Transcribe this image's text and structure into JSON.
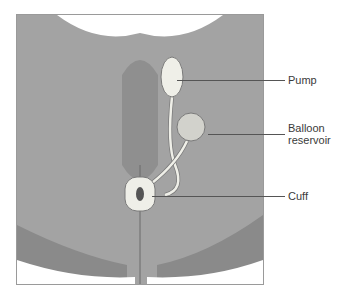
{
  "figure": {
    "type": "anatomical-illustration",
    "colors": {
      "frame_border": "#9a9a9a",
      "tissue_dark": "#8a8a8a",
      "tissue_mid": "#a3a3a3",
      "tissue_light": "#b8b8b8",
      "device_fill": "#efefe8",
      "device_stroke": "#7a7a7a",
      "leader_line": "#555555",
      "label_text": "#3a3a3a"
    }
  },
  "labels": [
    {
      "id": "pump",
      "text": "Pump"
    },
    {
      "id": "balloon",
      "text_line1": "Balloon",
      "text_line2": "reservoir"
    },
    {
      "id": "cuff",
      "text": "Cuff"
    }
  ]
}
